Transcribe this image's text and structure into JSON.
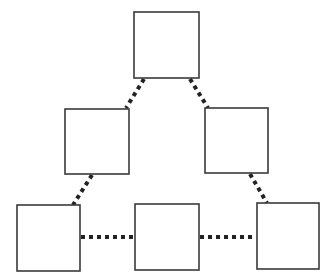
{
  "diagram": {
    "type": "hierarchy-triangle",
    "colors": {
      "background": "#ffffff",
      "node_border": "#3a3a3a",
      "edge": "#222222"
    },
    "nodes": [
      {
        "id": "top",
        "label": "",
        "x": 134,
        "y": 12,
        "w": 65,
        "h": 66
      },
      {
        "id": "mid-left",
        "label": "",
        "x": 65,
        "y": 109,
        "w": 64,
        "h": 65
      },
      {
        "id": "mid-right",
        "label": "",
        "x": 205,
        "y": 108,
        "w": 63,
        "h": 65
      },
      {
        "id": "bottom-left",
        "label": "",
        "x": 17,
        "y": 205,
        "w": 63,
        "h": 66
      },
      {
        "id": "bottom-middle",
        "label": "",
        "x": 135,
        "y": 204,
        "w": 64,
        "h": 66
      },
      {
        "id": "bottom-right",
        "label": "",
        "x": 257,
        "y": 203,
        "w": 62,
        "h": 66
      }
    ],
    "edges": [
      {
        "from": "top",
        "to": "mid-left",
        "style": "dotted",
        "x1": 144,
        "y1": 79,
        "x2": 126,
        "y2": 108
      },
      {
        "from": "top",
        "to": "mid-right",
        "style": "dotted",
        "x1": 190,
        "y1": 79,
        "x2": 208,
        "y2": 108
      },
      {
        "from": "mid-left",
        "to": "bottom-left",
        "style": "dotted",
        "x1": 92,
        "y1": 175,
        "x2": 73,
        "y2": 205
      },
      {
        "from": "mid-right",
        "to": "bottom-right",
        "style": "dotted",
        "x1": 250,
        "y1": 174,
        "x2": 267,
        "y2": 203
      },
      {
        "from": "bottom-left",
        "to": "bottom-middle",
        "style": "dotted",
        "x1": 81,
        "y1": 237,
        "x2": 134,
        "y2": 237
      },
      {
        "from": "bottom-middle",
        "to": "bottom-right",
        "style": "dotted",
        "x1": 200,
        "y1": 237,
        "x2": 256,
        "y2": 237
      }
    ]
  }
}
